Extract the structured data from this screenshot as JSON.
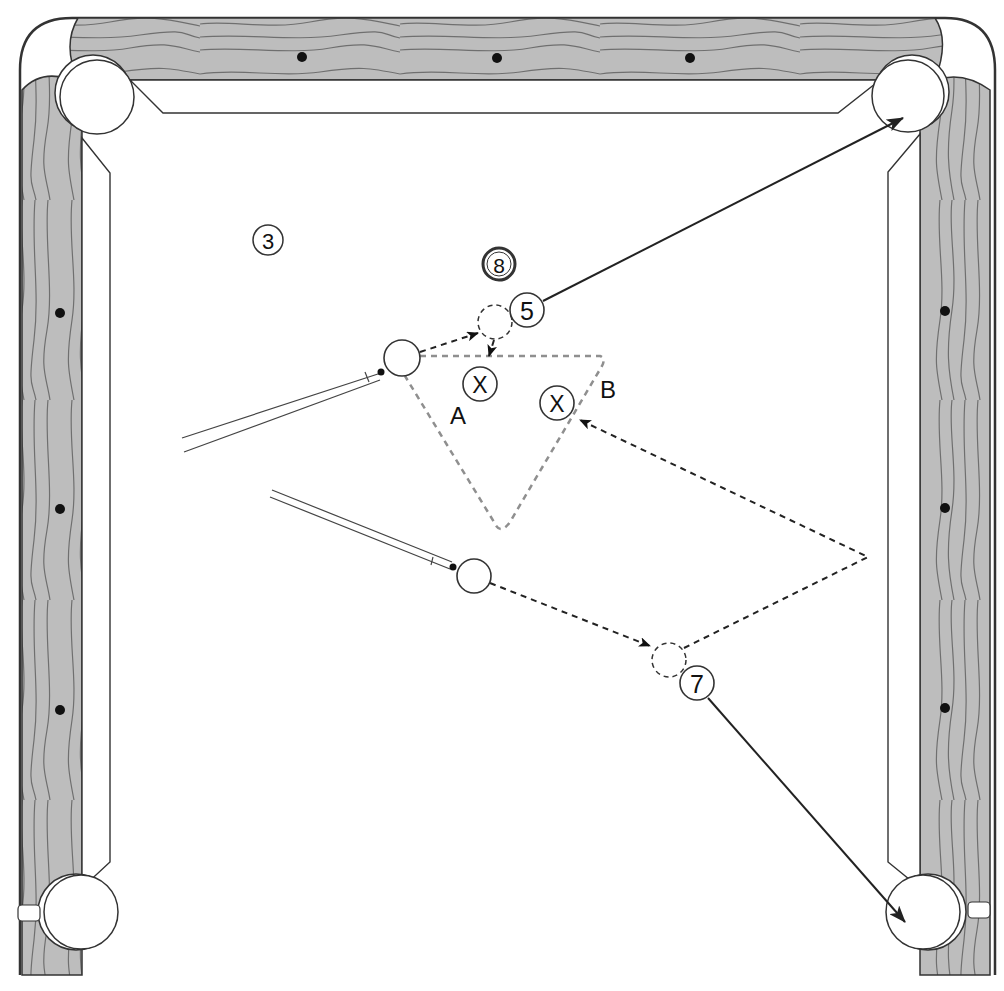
{
  "diagram": {
    "colors": {
      "wood": "#bdbdbd",
      "grain": "#6f6f6f",
      "outline": "#333333",
      "felt": "#ffffff",
      "diamond": "#111111",
      "zone_dash": "#8f8f8f",
      "path_dash": "#222222"
    },
    "balls": [
      {
        "id": "ball-3",
        "label": "3",
        "x": 268,
        "y": 240,
        "r": 15
      },
      {
        "id": "ball-8",
        "label": "8",
        "x": 499,
        "y": 264,
        "r": 15,
        "double_ring": true
      },
      {
        "id": "ball-5",
        "label": "5",
        "x": 527,
        "y": 310,
        "r": 17
      },
      {
        "id": "ball-7",
        "label": "7",
        "x": 697,
        "y": 683,
        "r": 17
      }
    ],
    "cue_balls": [
      {
        "id": "cue-ball-a",
        "x": 402,
        "y": 358,
        "r": 18
      },
      {
        "id": "cue-ball-b",
        "x": 474,
        "y": 576,
        "r": 17
      }
    ],
    "ghost_balls": [
      {
        "id": "ghost-ball-5",
        "x": 495,
        "y": 322,
        "r": 17
      },
      {
        "id": "ghost-ball-7",
        "x": 669,
        "y": 660,
        "r": 17
      }
    ],
    "target_markers": [
      {
        "id": "target-a",
        "label": "X",
        "x": 480,
        "y": 384,
        "r": 17
      },
      {
        "id": "target-b",
        "label": "X",
        "x": 557,
        "y": 403,
        "r": 17
      }
    ],
    "region_labels": [
      {
        "id": "label-a",
        "text": "A",
        "x": 458,
        "y": 415
      },
      {
        "id": "label-b",
        "text": "B",
        "x": 608,
        "y": 389
      }
    ]
  }
}
